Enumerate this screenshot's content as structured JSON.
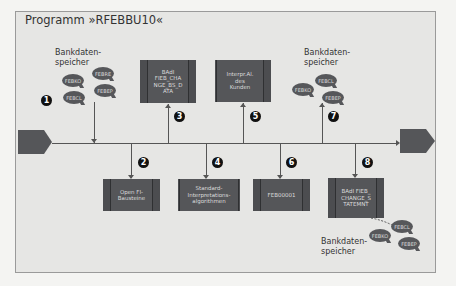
{
  "title": "Programm »RFEBBU10«",
  "colors": {
    "background": "#e6e6e4",
    "box_fill": "#555659",
    "bubble_fill": "#56575a",
    "line": "#555555",
    "number_badge": "#111111"
  },
  "storage_label": "Bankdaten-\nspeicher",
  "steps": [
    {
      "number": "1",
      "label": "Bankdatenspeicher",
      "direction": "in",
      "bubbles": [
        "FEBKO",
        "FEBRE",
        "FEBCL",
        "FEBEP"
      ]
    },
    {
      "number": "2",
      "label": "Open FI-\nBausteine",
      "direction": "out"
    },
    {
      "number": "3",
      "label": "BAdI\nFIEB_CHA\nNGE_BS_D\nATA",
      "direction": "in"
    },
    {
      "number": "4",
      "label": "Standard-\nInterpretations-\nalgorithmen",
      "direction": "out"
    },
    {
      "number": "5",
      "label": "Interpr.Al.\ndes\nKunden",
      "direction": "in"
    },
    {
      "number": "6",
      "label": "FEB00001",
      "direction": "out"
    },
    {
      "number": "7",
      "label": "Bankdatenspeicher",
      "direction": "in",
      "bubbles": [
        "FEBCL",
        "FEBKO",
        "FEBEP"
      ]
    },
    {
      "number": "8",
      "label": "BAdI FIEB_\nCHANGE_S\nTATEMNT",
      "direction": "out",
      "bubbles": [
        "FEBCL",
        "FEBKO",
        "FEBEP"
      ]
    }
  ]
}
